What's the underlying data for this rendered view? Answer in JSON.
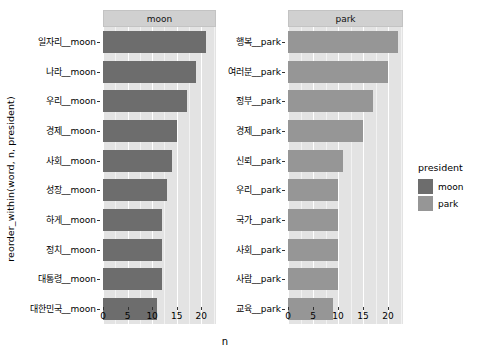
{
  "chart_data": {
    "type": "bar",
    "orientation": "horizontal",
    "title": "",
    "xlabel": "n",
    "ylabel": "reorder_within(word, n, president)",
    "xlim": [
      0,
      23
    ],
    "xticks": [
      0,
      5,
      10,
      15,
      20
    ],
    "xtick_labels": [
      "0",
      "5",
      "10",
      "15",
      "20"
    ],
    "grid": true,
    "legend": {
      "title": "president",
      "position": "right",
      "entries": [
        {
          "label": "moon",
          "color": "#6d6d6d"
        },
        {
          "label": "park",
          "color": "#969696"
        }
      ]
    },
    "facets": [
      {
        "name": "moon",
        "strip_label": "moon",
        "color": "#6d6d6d",
        "categories": [
          "일자리__moon",
          "나라__moon",
          "우리__moon",
          "경제__moon",
          "사회__moon",
          "성장__moon",
          "하게__moon",
          "정치__moon",
          "대통령__moon",
          "대한민국__moon"
        ],
        "values": [
          21,
          19,
          17,
          15,
          14,
          13,
          12,
          12,
          12,
          11
        ]
      },
      {
        "name": "park",
        "strip_label": "park",
        "color": "#969696",
        "categories": [
          "행복__park",
          "여러분__park",
          "정부__park",
          "경제__park",
          "신뢰__park",
          "우리__park",
          "국가__park",
          "사회__park",
          "사람__park",
          "교육__park"
        ],
        "values": [
          22,
          20,
          17,
          15,
          11,
          10,
          10,
          10,
          10,
          9
        ]
      }
    ],
    "theme": {
      "panel_background": "#e3e3e3",
      "strip_background": "#d0d0d0",
      "gridline_major": "#ffffff",
      "plot_background": "#ffffff"
    }
  }
}
